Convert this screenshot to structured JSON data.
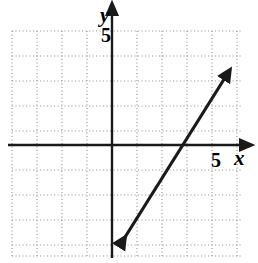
{
  "figure": {
    "kind": "cartesian-coordinate-plane-with-line",
    "background_color": "#ffffff",
    "ink_color": "#1a1a1a",
    "grid_color": "#9a9a9a"
  },
  "axes": {
    "x_axis_label": "x",
    "y_axis_label": "y",
    "x_tick_label": "5",
    "y_tick_label": "5",
    "x_tick_value": 5,
    "y_tick_value": 5,
    "origin_px": [
      112,
      145
    ],
    "unit_px": 25,
    "x_range": [
      -4,
      5.3
    ],
    "y_range": [
      -4.6,
      5.4
    ],
    "grid": "dotted",
    "grid_step": 1,
    "tick_marks_shown": false,
    "arrowheads": [
      "x-positive",
      "y-positive"
    ]
  },
  "chart_data": {
    "type": "line",
    "title": "",
    "xlabel": "x",
    "ylabel": "y",
    "xlim": [
      -4,
      5.3
    ],
    "ylim": [
      -4.6,
      5.4
    ],
    "grid": true,
    "legend": "none",
    "series": [
      {
        "name": "line",
        "x": [
          0.2,
          4.65
        ],
        "y": [
          -4.2,
          2.9
        ],
        "slope": 1.6,
        "y_intercept": -4.5,
        "x_intercept": 2.85,
        "equation": "y = 1.6x - 4.5",
        "endpoints_px": [
          [
            117,
            250
          ],
          [
            228,
            72
          ]
        ],
        "arrowheads": [
          "both"
        ],
        "color": "#1a1a1a",
        "width_px": 3
      }
    ],
    "xticks": [
      5
    ],
    "yticks": [
      5
    ],
    "xticklabels": [
      "5"
    ],
    "yticklabels": [
      "5"
    ]
  }
}
